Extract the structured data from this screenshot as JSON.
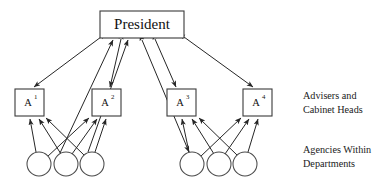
{
  "figure": {
    "type": "organizational-hierarchy-diagram",
    "title": "",
    "background_color": "#ffffff",
    "line_color": "#262626",
    "box_stroke_color": "#3a3a3a",
    "circle_stroke_color": "#4a4a4a",
    "text_color": "#111111"
  },
  "nodes": {
    "president": {
      "label": "President",
      "shape": "rectangle",
      "x": 100,
      "y": 11,
      "width": 84,
      "height": 27
    },
    "advisers": [
      {
        "id": "a1",
        "base": "A",
        "superscript": "1",
        "label": "A¹",
        "shape": "rectangle",
        "x": 15,
        "y": 89,
        "width": 29,
        "height": 27
      },
      {
        "id": "a2",
        "base": "A",
        "superscript": "2",
        "label": "A²",
        "shape": "rectangle",
        "x": 92,
        "y": 89,
        "width": 29,
        "height": 27
      },
      {
        "id": "a3",
        "base": "A",
        "superscript": "3",
        "label": "A³",
        "shape": "rectangle",
        "x": 167,
        "y": 89,
        "width": 29,
        "height": 27
      },
      {
        "id": "a4",
        "base": "A",
        "superscript": "4",
        "label": "A⁴",
        "shape": "rectangle",
        "x": 243,
        "y": 89,
        "width": 29,
        "height": 27
      }
    ],
    "agencies": [
      {
        "id": "g1",
        "shape": "circle",
        "cx": 39,
        "cy": 164,
        "r": 12
      },
      {
        "id": "g2",
        "shape": "circle",
        "cx": 66,
        "cy": 164,
        "r": 12
      },
      {
        "id": "g3",
        "shape": "circle",
        "cx": 92,
        "cy": 164,
        "r": 12
      },
      {
        "id": "g4",
        "shape": "circle",
        "cx": 192,
        "cy": 164,
        "r": 12
      },
      {
        "id": "g5",
        "shape": "circle",
        "cx": 219,
        "cy": 164,
        "r": 12
      },
      {
        "id": "g6",
        "shape": "circle",
        "cx": 245,
        "cy": 164,
        "r": 12
      }
    ]
  },
  "captions": {
    "advisers_caption_line1": "Advisers and",
    "advisers_caption_line2": "Cabinet Heads",
    "agencies_caption_line1": "Agencies Within",
    "agencies_caption_line2": "Departments"
  },
  "edges": [
    {
      "id": "e-pres-a1",
      "from": "president",
      "to": "a1",
      "arrow": "both"
    },
    {
      "id": "e-pres-a2",
      "from": "president",
      "to": "a2",
      "arrow": "both"
    },
    {
      "id": "e-pres-a3",
      "from": "president",
      "to": "a3",
      "arrow": "both"
    },
    {
      "id": "e-pres-a4",
      "from": "president",
      "to": "a4",
      "arrow": "both"
    },
    {
      "id": "e-pres-g3",
      "from": "g3",
      "to": "president",
      "arrow": "end"
    },
    {
      "id": "e-pres-g2",
      "from": "g2",
      "to": "president",
      "arrow": "end"
    },
    {
      "id": "e-pres-g4",
      "from": "president",
      "to": "g4",
      "arrow": "both"
    },
    {
      "id": "e-g1-a1",
      "from": "g1",
      "to": "a1",
      "arrow": "end"
    },
    {
      "id": "e-g2-a1",
      "from": "g2",
      "to": "a1",
      "arrow": "end"
    },
    {
      "id": "e-g3-a1",
      "from": "g3",
      "to": "a1",
      "arrow": "end"
    },
    {
      "id": "e-g1-a2",
      "from": "g1",
      "to": "a2",
      "arrow": "end"
    },
    {
      "id": "e-g2-a2",
      "from": "g2",
      "to": "a2",
      "arrow": "end"
    },
    {
      "id": "e-g3-a2",
      "from": "g3",
      "to": "a2",
      "arrow": "end"
    },
    {
      "id": "e-g4-a3",
      "from": "g4",
      "to": "a3",
      "arrow": "end"
    },
    {
      "id": "e-g5-a3",
      "from": "g5",
      "to": "a3",
      "arrow": "end"
    },
    {
      "id": "e-g6-a3",
      "from": "g6",
      "to": "a3",
      "arrow": "end"
    },
    {
      "id": "e-g4-a4",
      "from": "g4",
      "to": "a4",
      "arrow": "end"
    },
    {
      "id": "e-g5-a4",
      "from": "g5",
      "to": "a4",
      "arrow": "end"
    },
    {
      "id": "e-g6-a4",
      "from": "g6",
      "to": "a4",
      "arrow": "end"
    }
  ]
}
